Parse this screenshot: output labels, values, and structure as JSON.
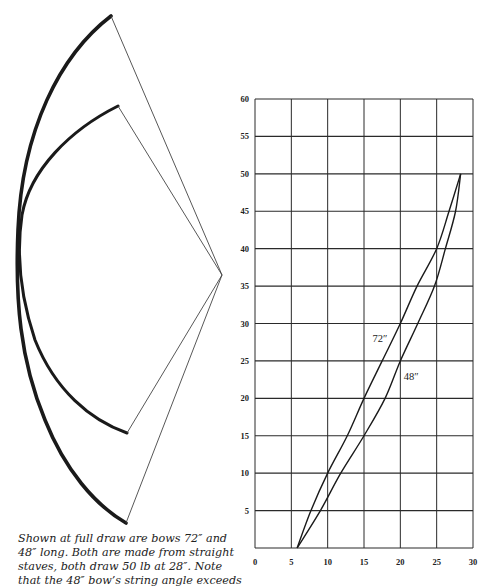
{
  "caption": {
    "lines": [
      "Shown at full draw are bows 72″ and",
      "48″ long. Both are made from straight",
      "staves, both draw 50 lb at 28″. Note",
      "that the 48″ bow’s string angle exceeds"
    ]
  },
  "bows": {
    "long_label": "72″ bow",
    "short_label": "48″ bow",
    "color": "#1a1a1a"
  },
  "chart_data": {
    "type": "line",
    "title": "",
    "xlabel": "",
    "ylabel": "",
    "xlim": [
      0,
      30
    ],
    "ylim": [
      0,
      60
    ],
    "x_ticks": [
      0,
      5,
      10,
      15,
      20,
      25,
      30
    ],
    "y_ticks": [
      5,
      10,
      15,
      20,
      25,
      30,
      35,
      40,
      45,
      50,
      55,
      60
    ],
    "grid": true,
    "legend": "inline labels",
    "series": [
      {
        "name": "72″",
        "x": [
          5.8,
          7.7,
          10,
          12.7,
          15,
          17.5,
          20,
          22.3,
          25,
          26.7,
          28.3
        ],
        "y": [
          0,
          5,
          10,
          15,
          20,
          25,
          30,
          35,
          40,
          45,
          50
        ]
      },
      {
        "name": "48″",
        "x": [
          5.8,
          9,
          11.8,
          15,
          17.9,
          20,
          22.4,
          24.7,
          26.2,
          27.6,
          28.3
        ],
        "y": [
          0,
          5,
          10,
          15,
          20,
          25,
          30,
          35,
          40,
          45,
          50
        ]
      }
    ],
    "annotations": [
      {
        "text": "72″",
        "x": 17.2,
        "y": 27.5
      },
      {
        "text": "48″",
        "x": 21.5,
        "y": 22.5
      }
    ]
  }
}
